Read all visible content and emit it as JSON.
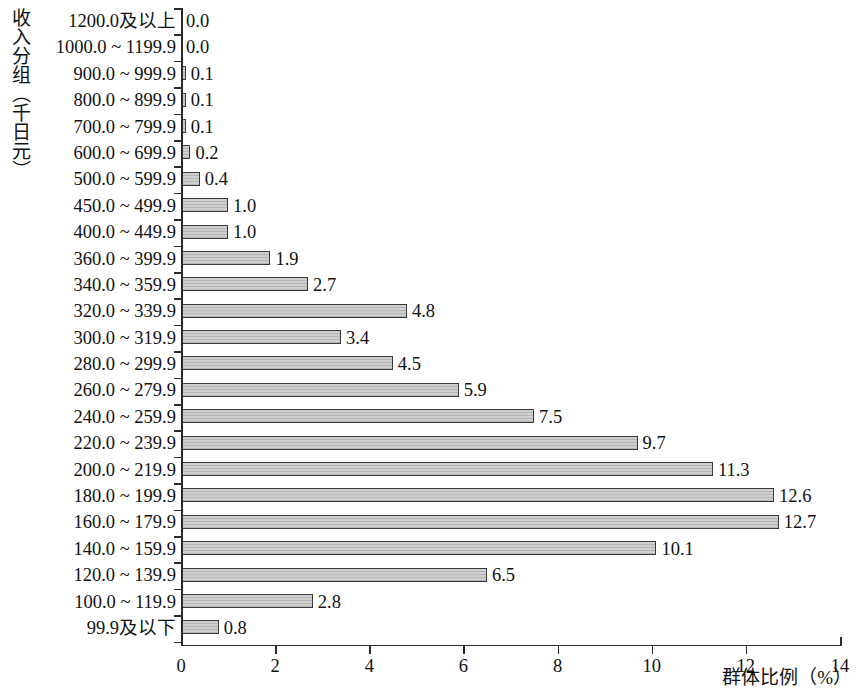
{
  "chart_data": {
    "type": "bar",
    "orientation": "horizontal",
    "title": "",
    "xlabel": "群体比例（%）",
    "ylabel": "收入分组（千日元）",
    "xlim": [
      0,
      14
    ],
    "xticks": [
      "0",
      "2",
      "4",
      "6",
      "8",
      "10",
      "12",
      "14"
    ],
    "xtick_values": [
      0,
      2,
      4,
      6,
      8,
      10,
      12,
      14
    ],
    "grid": false,
    "legend": null,
    "value_label_format": "one-decimal",
    "categories": [
      "1200.0及以上",
      "1000.0 ~ 1199.9",
      "900.0 ~ 999.9",
      "800.0 ~ 899.9",
      "700.0 ~ 799.9",
      "600.0 ~ 699.9",
      "500.0 ~ 599.9",
      "450.0 ~ 499.9",
      "400.0 ~ 449.9",
      "360.0 ~ 399.9",
      "340.0 ~ 359.9",
      "320.0 ~ 339.9",
      "300.0 ~ 319.9",
      "280.0 ~ 299.9",
      "260.0 ~ 279.9",
      "240.0 ~ 259.9",
      "220.0 ~ 239.9",
      "200.0 ~ 219.9",
      "180.0 ~ 199.9",
      "160.0 ~ 179.9",
      "140.0 ~ 159.9",
      "120.0 ~ 139.9",
      "100.0 ~ 119.9",
      "99.9及以下"
    ],
    "values": [
      0.0,
      0.0,
      0.1,
      0.1,
      0.1,
      0.2,
      0.4,
      1.0,
      1.0,
      1.9,
      2.7,
      4.8,
      3.4,
      4.5,
      5.9,
      7.5,
      9.7,
      11.3,
      12.6,
      12.7,
      10.1,
      6.5,
      2.8,
      0.8
    ],
    "value_labels": [
      "0.0",
      "0.0",
      "0.1",
      "0.1",
      "0.1",
      "0.2",
      "0.4",
      "1.0",
      "1.0",
      "1.9",
      "2.7",
      "4.8",
      "3.4",
      "4.5",
      "5.9",
      "7.5",
      "9.7",
      "11.3",
      "12.6",
      "12.7",
      "10.1",
      "6.5",
      "2.8",
      "0.8"
    ],
    "bar_fill_color": "#cfcfcf",
    "bar_edge_color": "#3a3a3a",
    "axis_color": "#2b2b2b"
  }
}
